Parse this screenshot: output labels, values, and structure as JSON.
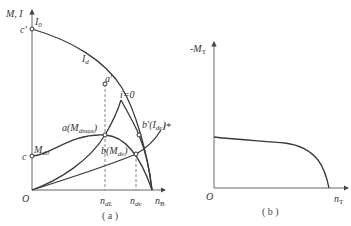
{
  "diagram_a": {
    "y_axis_label": "M, I",
    "origin": "O",
    "point_c_prime": "c'",
    "point_c": "c",
    "I0": "I",
    "I0_sub": "0",
    "Id": "I",
    "Id_sub": "d",
    "a_prime": "a'",
    "i_zero": "i=0",
    "i_star": "i*",
    "M_d0": "M",
    "M_d0_sub": "d0",
    "a_label": "a(M",
    "a_label_sub": "dmax",
    "a_label_end": ")",
    "b_prime_label": "b'(I",
    "b_prime_sub": "de",
    "b_prime_end": ")",
    "b_label": "b(M",
    "b_label_sub": "de",
    "b_label_end": ")",
    "x_ticks": [
      {
        "text": "n",
        "sub": "dL"
      },
      {
        "text": "n",
        "sub": "de"
      },
      {
        "text": "n",
        "sub": "B"
      }
    ],
    "caption": "( a )"
  },
  "diagram_b": {
    "y_axis_label": "-M",
    "y_axis_sub": "T",
    "origin": "O",
    "x_axis_label": "n",
    "x_axis_sub": "T",
    "caption": "( b )"
  }
}
